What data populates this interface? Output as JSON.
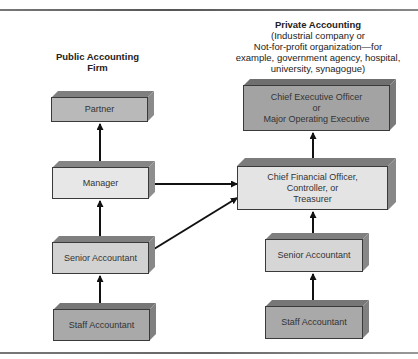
{
  "diagram": {
    "type": "organizational-career-path",
    "columns": {
      "public": {
        "heading": "Public Accounting\nFirm",
        "heading_lines": [
          "Public Accounting",
          "Firm"
        ],
        "boxes": [
          {
            "id": "partner",
            "label": "Partner",
            "shade": "#b9b9b9"
          },
          {
            "id": "manager",
            "label": "Manager",
            "shade": "#e7e7e7"
          },
          {
            "id": "senior",
            "label": "Senior Accountant",
            "shade": "#d2d2d2"
          },
          {
            "id": "staff",
            "label": "Staff Accountant",
            "shade": "#a9a9a9"
          }
        ]
      },
      "private": {
        "heading_title": "Private Accounting",
        "heading_lines": [
          "(Industrial company or",
          "Not-for-profit organization—for",
          "example, government agency, hospital,",
          "university, synagogue)"
        ],
        "boxes": [
          {
            "id": "ceo",
            "label_lines": [
              "Chief Executive Officer",
              "or",
              "Major Operating Executive"
            ],
            "shade": "#a3a3a3"
          },
          {
            "id": "cfo",
            "label_lines": [
              "Chief Financial Officer,",
              "Controller, or",
              "Treasurer"
            ],
            "shade": "#e4e4e4"
          },
          {
            "id": "senior",
            "label": "Senior Accountant",
            "shade": "#d6d6d6"
          },
          {
            "id": "staff",
            "label": "Staff Accountant",
            "shade": "#a9a9a9"
          }
        ]
      }
    },
    "connections": [
      {
        "from": "public.staff",
        "to": "public.senior"
      },
      {
        "from": "public.senior",
        "to": "public.manager"
      },
      {
        "from": "public.manager",
        "to": "public.partner"
      },
      {
        "from": "public.manager",
        "to": "private.cfo"
      },
      {
        "from": "public.senior",
        "to": "private.cfo"
      },
      {
        "from": "private.staff",
        "to": "private.senior"
      },
      {
        "from": "private.senior",
        "to": "private.cfo"
      },
      {
        "from": "private.cfo",
        "to": "private.ceo"
      }
    ]
  }
}
